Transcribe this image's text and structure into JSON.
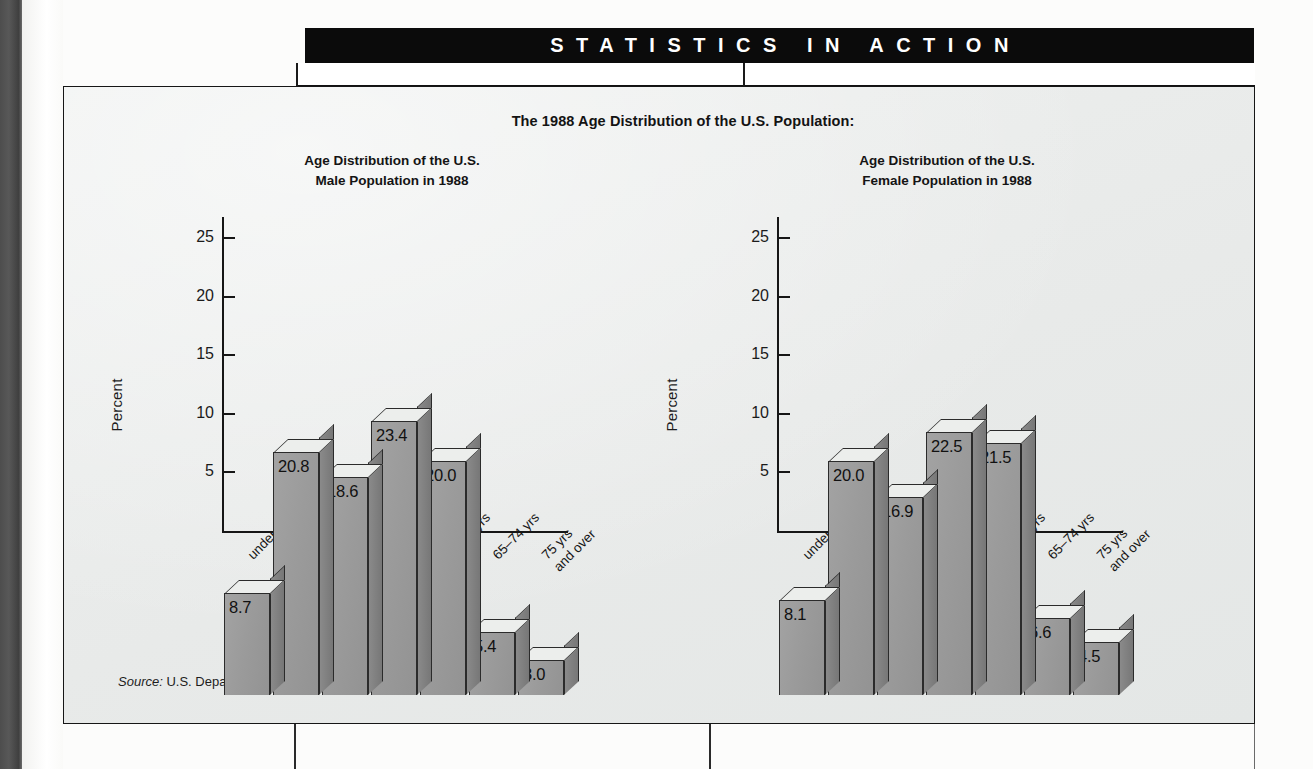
{
  "banner": {
    "label": "STATISTICS IN ACTION"
  },
  "figure": {
    "main_title": "The 1988 Age Distribution of the U.S. Population:",
    "source_prefix": "Source:",
    "source_text": "U.S. Department of Commerce, Bureau of the Census, 1989."
  },
  "charts": [
    {
      "title_line1": "Age Distribution of the U.S.",
      "title_line2": "Male Population in 1988",
      "ylabel": "Percent",
      "xlabel": "Age"
    },
    {
      "title_line1": "Age Distribution of the U.S.",
      "title_line2": "Female Population in 1988",
      "ylabel": "Percent",
      "xlabel": "Age"
    }
  ],
  "axis": {
    "yticks": [
      "25",
      "20",
      "15",
      "10",
      "5"
    ],
    "categories": [
      {
        "l1": "under 5 yrs",
        "l2": ""
      },
      {
        "l1": "5–14 yrs",
        "l2": ""
      },
      {
        "l1": "15–24 yrs",
        "l2": ""
      },
      {
        "l1": "25–44 yrs",
        "l2": ""
      },
      {
        "l1": "45–64 yrs",
        "l2": ""
      },
      {
        "l1": "65–74 yrs",
        "l2": ""
      },
      {
        "l1": "75 yrs",
        "l2": "and over"
      }
    ]
  },
  "chart_data": [
    {
      "type": "bar",
      "title": "Age Distribution of the U.S. Male Population in 1988",
      "xlabel": "Age",
      "ylabel": "Percent",
      "categories": [
        "under 5 yrs",
        "5–14 yrs",
        "15–24 yrs",
        "25–44 yrs",
        "45–64 yrs",
        "65–74 yrs",
        "75 yrs and over"
      ],
      "values": [
        8.7,
        20.8,
        18.6,
        23.4,
        20.0,
        5.4,
        3.0
      ],
      "labels": [
        "8.7",
        "20.8",
        "18.6",
        "23.4",
        "20.0",
        "5.4",
        "3.0"
      ],
      "ylim": [
        0,
        27
      ],
      "yticks": [
        5,
        10,
        15,
        20,
        25
      ],
      "grid": false,
      "legend": "none",
      "style": "3d-bar"
    },
    {
      "type": "bar",
      "title": "Age Distribution of the U.S. Female Population in 1988",
      "xlabel": "Age",
      "ylabel": "Percent",
      "categories": [
        "under 5 yrs",
        "5–14 yrs",
        "15–24 yrs",
        "25–44 yrs",
        "45–64 yrs",
        "65–74 yrs",
        "75 yrs and over"
      ],
      "values": [
        8.1,
        20.0,
        16.9,
        22.5,
        21.5,
        6.6,
        4.5
      ],
      "labels": [
        "8.1",
        "20.0",
        "16.9",
        "22.5",
        "21.5",
        "6.6",
        "4.5"
      ],
      "ylim": [
        0,
        27
      ],
      "yticks": [
        5,
        10,
        15,
        20,
        25
      ],
      "grid": false,
      "legend": "none",
      "style": "3d-bar"
    }
  ],
  "colors": {
    "banner_bg": "#0b0b0b",
    "banner_text": "#ffffff",
    "panel_bg": "#eceeed",
    "bar_face": "#9b9b9b",
    "bar_side": "#7d7d7d",
    "bar_top": "#eceeec",
    "ink": "#161616"
  }
}
